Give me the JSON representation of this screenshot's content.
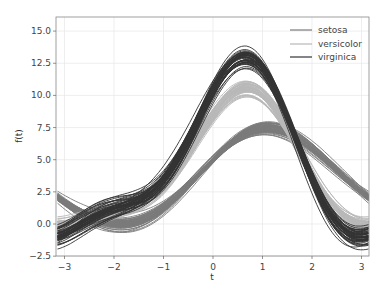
{
  "chart_data": {
    "type": "line",
    "title": "",
    "subtitle": "Andrews curves",
    "xlabel": "t",
    "ylabel": "f(t)",
    "xlim": [
      -3.14159,
      3.14159
    ],
    "ylim": [
      -2.5,
      16
    ],
    "xticks": [
      -3,
      -2,
      -1,
      0,
      1,
      2,
      3
    ],
    "yticks": [
      -2.5,
      0.0,
      2.5,
      5.0,
      7.5,
      10.0,
      12.5,
      15.0
    ],
    "ytick_labels": [
      "−2.5",
      "0.0",
      "2.5",
      "5.0",
      "7.5",
      "10.0",
      "12.5",
      "15.0"
    ],
    "xtick_labels": [
      "−3",
      "−2",
      "−1",
      "0",
      "1",
      "2",
      "3"
    ],
    "grid": true,
    "legend_position": "upper right",
    "series": [
      {
        "name": "setosa",
        "color": "#7a7a7a",
        "mean": [
          5.01,
          3.43,
          1.46,
          0.25
        ],
        "spread": [
          0.35,
          0.38,
          0.17,
          0.1
        ]
      },
      {
        "name": "versicolor",
        "color": "#b8b8b8",
        "mean": [
          5.94,
          2.77,
          4.26,
          1.33
        ],
        "spread": [
          0.5,
          0.31,
          0.47,
          0.2
        ]
      },
      {
        "name": "virginica",
        "color": "#333333",
        "mean": [
          6.59,
          2.97,
          5.55,
          2.03
        ],
        "spread": [
          0.63,
          0.32,
          0.55,
          0.27
        ]
      }
    ],
    "samples_per_class": 50
  },
  "legend": {
    "items": [
      {
        "label": "setosa",
        "color": "#7a7a7a"
      },
      {
        "label": "versicolor",
        "color": "#b8b8b8"
      },
      {
        "label": "virginica",
        "color": "#333333"
      }
    ]
  }
}
